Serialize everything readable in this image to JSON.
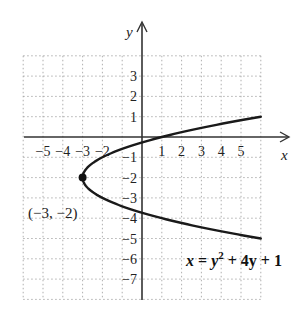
{
  "chart_data": {
    "type": "line",
    "title": "",
    "xlabel": "x",
    "ylabel": "y",
    "xlim": [
      -6,
      6
    ],
    "ylim": [
      -8,
      4
    ],
    "grid": true,
    "x_ticks": [
      "-5",
      "-4",
      "-3",
      "-2",
      "1",
      "2",
      "3",
      "4",
      "5"
    ],
    "y_ticks": [
      "3",
      "2",
      "1",
      "-1",
      "-2",
      "-3",
      "-4",
      "-5",
      "-6",
      "-7"
    ],
    "series": [
      {
        "name": "x = y^2 + 4y + 1",
        "equation": "x = y² + 4y + 1",
        "parametric_y_range": [
          -5,
          1
        ],
        "points": [
          {
            "x": 6,
            "y": -5
          },
          {
            "x": 1,
            "y": -4
          },
          {
            "x": -2,
            "y": -3
          },
          {
            "x": -3,
            "y": -2
          },
          {
            "x": -2,
            "y": -1
          },
          {
            "x": 1,
            "y": 0
          },
          {
            "x": 6,
            "y": 1
          }
        ]
      }
    ],
    "annotations": [
      {
        "label": "(−3, −2)",
        "x": -3,
        "y": -2,
        "marker": "filled-dot",
        "note": "vertex"
      },
      {
        "label": "x = y² + 4y + 1",
        "position": "lower-right"
      }
    ]
  },
  "labels": {
    "x_axis": "x",
    "y_axis": "y",
    "vertex": "(−3, −2)",
    "equation_x": "x",
    "equation_eq": " = ",
    "equation_y": "y",
    "equation_exp": "2",
    "equation_rest": " + 4y + 1"
  }
}
